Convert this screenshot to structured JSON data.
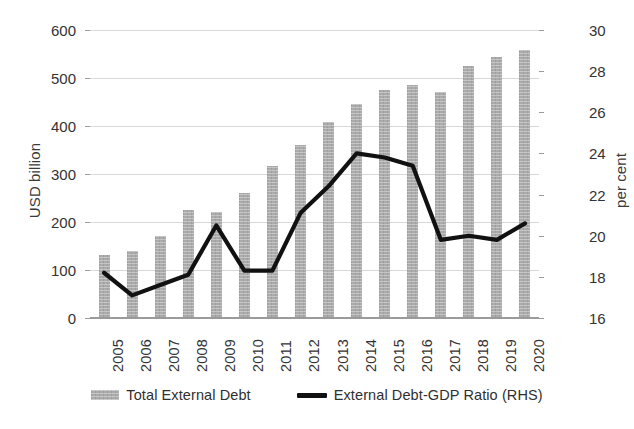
{
  "chart_data": {
    "type": "bar",
    "title": "",
    "xlabel": "",
    "ylabel": "USD billion",
    "y2label": "per cent",
    "grid": true,
    "legend_position": "bottom",
    "categories": [
      "2005",
      "2006",
      "2007",
      "2008",
      "2009",
      "2010",
      "2011",
      "2012",
      "2013",
      "2014",
      "2015",
      "2016",
      "2017",
      "2018",
      "2019",
      "2020"
    ],
    "ylim": [
      0,
      600
    ],
    "y2lim": [
      16,
      30
    ],
    "yticks": [
      0,
      100,
      200,
      300,
      400,
      500,
      600
    ],
    "y2ticks": [
      16,
      18,
      20,
      22,
      24,
      26,
      28,
      30
    ],
    "ytick_labels": [
      "0",
      "100",
      "200",
      "300",
      "400",
      "500",
      "600"
    ],
    "y2tick_labels": [
      "16",
      "18",
      "20",
      "22",
      "24",
      "26",
      "28",
      "30"
    ],
    "series": [
      {
        "name": "Total External Debt",
        "type": "bar",
        "axis": "left",
        "unit": "USD billion",
        "color": "#ababab",
        "values": [
          132,
          140,
          171,
          224,
          220,
          261,
          317,
          360,
          409,
          446,
          474,
          485,
          470,
          526,
          543,
          558
        ]
      },
      {
        "name": "External Debt-GDP Ratio (RHS)",
        "type": "line",
        "axis": "right",
        "unit": "per cent",
        "color": "#111111",
        "values": [
          18.2,
          17.1,
          17.6,
          18.1,
          20.5,
          18.3,
          18.3,
          21.1,
          22.4,
          24.0,
          23.8,
          23.4,
          19.8,
          20.0,
          19.8,
          20.6
        ]
      }
    ]
  },
  "legend": {
    "items": [
      {
        "label": "Total External Debt",
        "marker": "bar-swatch"
      },
      {
        "label": "External Debt-GDP Ratio (RHS)",
        "marker": "line-swatch"
      }
    ]
  },
  "axes": {
    "left_title": "USD billion",
    "right_title": "per cent"
  }
}
